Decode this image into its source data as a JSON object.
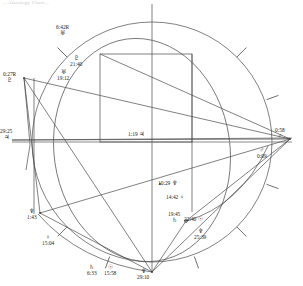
{
  "header": {
    "faint_text": "...Astrology Chart..."
  },
  "chart_data": {
    "type": "scatter",
    "grid": false,
    "legend": "none",
    "wheel": {
      "center_x": 152,
      "center_y": 142,
      "radius": 120,
      "tick_count": 8
    },
    "points": [
      {
        "id": "uranus-outer-top",
        "glyph": "♅",
        "name": "Uranus",
        "value": "6:42R",
        "x": 70,
        "y": 30,
        "label_x": 56,
        "label_y": 24,
        "order": "degree-first"
      },
      {
        "id": "pluto",
        "glyph": "♇",
        "name": "Pluto",
        "value": "21:40",
        "x": 83,
        "y": 60,
        "label_x": 70,
        "label_y": 55,
        "order": "glyph-first"
      },
      {
        "id": "uranus-inner",
        "glyph": "♅",
        "name": "Uranus",
        "value": "19:12",
        "x": 70,
        "y": 73,
        "label_x": 57,
        "label_y": 69,
        "order": "glyph-first"
      },
      {
        "id": "pluto-left",
        "glyph": "♇",
        "name": "Pluto",
        "value": "0:27R",
        "x": 24,
        "y": 78,
        "label_x": 3,
        "label_y": 71,
        "order": "degree-first"
      },
      {
        "id": "jupiter-asc",
        "glyph": "♃",
        "name": "Jupiter",
        "value": "29:25",
        "x": 14,
        "y": 141,
        "label_x": 0,
        "label_y": 128,
        "order": "degree-first"
      },
      {
        "id": "jupiter-center",
        "glyph": "♃",
        "name": "Jupiter",
        "value": "1:19",
        "x": 152,
        "y": 138,
        "label_x": 128,
        "label_y": 131,
        "order": "inline"
      },
      {
        "id": "mars-dsc",
        "glyph": "♂",
        "name": "Mars",
        "value": "0:58",
        "x": 290,
        "y": 139,
        "label_x": 275,
        "label_y": 127,
        "order": "degree-first"
      },
      {
        "id": "mars-inner",
        "glyph": "♂",
        "name": "Mars",
        "value": "0:09",
        "x": 268,
        "y": 146,
        "label_x": 257,
        "label_y": 147,
        "order": "glyph-first"
      },
      {
        "id": "neptune-mid",
        "glyph": "♆",
        "name": "Neptune",
        "value": "10:29",
        "x": 160,
        "y": 184,
        "label_x": 158,
        "label_y": 180,
        "order": "inline"
      },
      {
        "id": "venus-mid",
        "glyph": "♀",
        "name": "Venus",
        "value": "14:42",
        "x": 168,
        "y": 198,
        "label_x": 166,
        "label_y": 194,
        "order": "inline"
      },
      {
        "id": "saturn-right",
        "glyph": "♄",
        "name": "Saturn",
        "value": "19:45",
        "x": 178,
        "y": 219,
        "label_x": 168,
        "label_y": 211,
        "order": "degree-first"
      },
      {
        "id": "sun-right",
        "glyph": "☉",
        "name": "Sun",
        "value": "22:40",
        "x": 186,
        "y": 221,
        "label_x": 184,
        "label_y": 216,
        "order": "inline"
      },
      {
        "id": "neptune-lowright",
        "glyph": "♆",
        "name": "Neptune",
        "value": "25:39",
        "x": 205,
        "y": 232,
        "label_x": 194,
        "label_y": 228,
        "order": "glyph-first"
      },
      {
        "id": "neptune-left",
        "glyph": "♆",
        "name": "Neptune",
        "value": "1:43",
        "x": 40,
        "y": 213,
        "label_x": 27,
        "label_y": 208,
        "order": "glyph-first"
      },
      {
        "id": "venus-left",
        "glyph": "♀",
        "name": "Venus",
        "value": "15:04",
        "x": 54,
        "y": 240,
        "label_x": 42,
        "label_y": 234,
        "order": "glyph-first"
      },
      {
        "id": "saturn-bottom",
        "glyph": "♄",
        "name": "Saturn",
        "value": "6:33",
        "x": 99,
        "y": 270,
        "label_x": 87,
        "label_y": 264,
        "order": "glyph-first"
      },
      {
        "id": "sun-bottom",
        "glyph": "☉",
        "name": "Sun",
        "value": "15:58",
        "x": 116,
        "y": 270,
        "label_x": 104,
        "label_y": 264,
        "order": "glyph-first"
      },
      {
        "id": "neptune-ic",
        "glyph": "♆",
        "name": "Neptune",
        "value": "29:10",
        "x": 152,
        "y": 272,
        "label_x": 137,
        "label_y": 268,
        "order": "glyph-first"
      }
    ],
    "colors": {
      "stroke": "#4a4a4a",
      "text": "#222222",
      "background": "#ffffff"
    }
  }
}
